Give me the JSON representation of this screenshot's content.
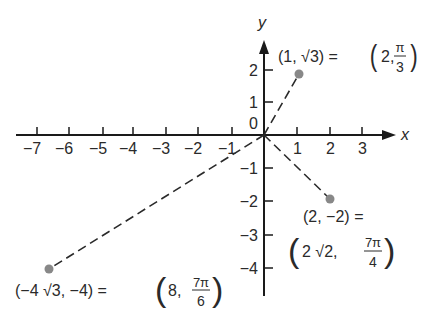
{
  "axes": {
    "x_label": "x",
    "y_label": "y",
    "origin_label": "0",
    "x_ticks": [
      {
        "label": "−7",
        "px": 37
      },
      {
        "label": "−6",
        "px": 69
      },
      {
        "label": "−5",
        "px": 103
      },
      {
        "label": "−4",
        "px": 133
      },
      {
        "label": "−3",
        "px": 166
      },
      {
        "label": "−2",
        "px": 198
      },
      {
        "label": "−1",
        "px": 232
      },
      {
        "label": "1",
        "px": 297
      },
      {
        "label": "2",
        "px": 330
      },
      {
        "label": "3",
        "px": 362
      }
    ],
    "y_ticks": [
      {
        "label": "2",
        "py": 70
      },
      {
        "label": "1",
        "py": 102
      },
      {
        "label": "−1",
        "py": 168
      },
      {
        "label": "−2",
        "py": 201
      },
      {
        "label": "−3",
        "py": 235
      },
      {
        "label": "−4",
        "py": 268
      }
    ]
  },
  "points": [
    {
      "name": "p1",
      "cartesian": "(1, √3)",
      "polar_r": "2",
      "polar_theta_num": "π",
      "polar_theta_den": "3",
      "px": 299,
      "py": 74
    },
    {
      "name": "p2",
      "cartesian": "(2, −2) =",
      "polar_r": "2 √2,",
      "polar_theta_num": "7π",
      "polar_theta_den": "4",
      "px": 330,
      "py": 199
    },
    {
      "name": "p3",
      "cartesian": "(−4 √3, −4) =",
      "polar_r": "8,",
      "polar_theta_num": "7π",
      "polar_theta_den": "6",
      "px": 49,
      "py": 269
    }
  ],
  "labels": {
    "p1_left": "(1, √3) =",
    "p1_r": "2,",
    "eq": "="
  },
  "colors": {
    "axis": "#1a1a1a",
    "dash": "#2a2a2a",
    "point": "#888888"
  }
}
